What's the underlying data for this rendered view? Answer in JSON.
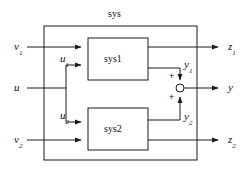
{
  "diagram": {
    "title": "sys",
    "type": "block-diagram",
    "outer_box": {
      "label": "sys",
      "x": 44,
      "y": 26,
      "width": 153,
      "height": 134
    },
    "blocks": [
      {
        "id": "sys1",
        "label": "sys1",
        "x": 88,
        "y": 38,
        "width": 60,
        "height": 42
      },
      {
        "id": "sys2",
        "label": "sys2",
        "x": 88,
        "y": 108,
        "width": 60,
        "height": 42
      }
    ],
    "inputs": [
      {
        "id": "v1",
        "base": "v",
        "sub": "1",
        "label": "v1",
        "y": 47
      },
      {
        "id": "u",
        "base": "u",
        "sub": "",
        "label": "u",
        "y": 88
      },
      {
        "id": "v2",
        "base": "v",
        "sub": "2",
        "label": "v2",
        "y": 140
      }
    ],
    "internal_signals": [
      {
        "id": "u1",
        "base": "u",
        "sub": "1",
        "label": "u1"
      },
      {
        "id": "u2",
        "base": "u",
        "sub": "2",
        "label": "u2"
      },
      {
        "id": "y1",
        "base": "y",
        "sub": "1",
        "label": "y1"
      },
      {
        "id": "y2",
        "base": "y",
        "sub": "2",
        "label": "y2"
      }
    ],
    "outputs": [
      {
        "id": "z1",
        "base": "z",
        "sub": "1",
        "label": "z1",
        "y": 47
      },
      {
        "id": "y",
        "base": "y",
        "sub": "",
        "label": "y",
        "y": 88
      },
      {
        "id": "z2",
        "base": "z",
        "sub": "2",
        "label": "z2",
        "y": 140
      }
    ],
    "summing_junction": {
      "id": "sum",
      "cx": 180,
      "cy": 88,
      "r": 4,
      "signs": [
        "+",
        "+"
      ],
      "top_sign": "+",
      "bottom_sign": "+"
    },
    "colors": {
      "line": "#1a1a1a",
      "text": "#111111",
      "background": "#ffffff"
    }
  }
}
